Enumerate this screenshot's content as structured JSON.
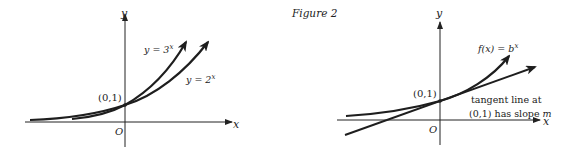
{
  "figure": {
    "caption": "Figure 2"
  },
  "left_graph": {
    "x_axis_label": "x",
    "y_axis_label": "y",
    "origin_label": "O",
    "point_label": "(0,1)",
    "curve_3x_label_base": "y = 3",
    "curve_3x_label_exp": "x",
    "curve_2x_label_base": "y = 2",
    "curve_2x_label_exp": "x"
  },
  "right_graph": {
    "x_axis_label": "x",
    "y_axis_label": "y",
    "origin_label": "O",
    "point_label": "(0,1)",
    "curve_label_base": "f(x) = b",
    "curve_label_exp": "x",
    "tangent_label_line1": "tangent line at",
    "tangent_label_line2_prefix": "(0,1) has slope ",
    "tangent_label_line2_var": "m"
  },
  "colors": {
    "axis": "#222222",
    "curve": "#1e1e1e",
    "text": "#222222",
    "background": "#ffffff"
  }
}
